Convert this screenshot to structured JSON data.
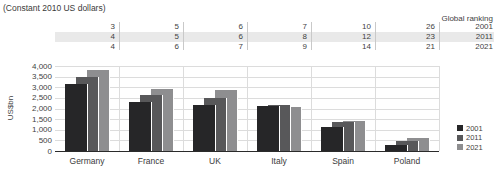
{
  "subtitle": "(Constant 2010 US dollars)",
  "ranking": {
    "header": "Global ranking",
    "rows": [
      {
        "year": "2001",
        "values": [
          "3",
          "5",
          "6",
          "7",
          "10",
          "26"
        ]
      },
      {
        "year": "2011",
        "values": [
          "4",
          "5",
          "6",
          "8",
          "12",
          "23"
        ]
      },
      {
        "year": "2021",
        "values": [
          "4",
          "6",
          "7",
          "9",
          "14",
          "21"
        ]
      }
    ]
  },
  "chart_data": {
    "type": "bar",
    "title": "(Constant 2010 US dollars)",
    "ylabel": "US$bn",
    "ylim": [
      0,
      4000
    ],
    "ytick_step": 500,
    "grid": true,
    "legend_position": "right",
    "categories": [
      "Germany",
      "France",
      "UK",
      "Italy",
      "Spain",
      "Poland"
    ],
    "series": [
      {
        "name": "2001",
        "color": "#262628",
        "values": [
          3150,
          2300,
          2150,
          2100,
          1150,
          300
        ]
      },
      {
        "name": "2011",
        "color": "#58585a",
        "values": [
          3500,
          2650,
          2500,
          2150,
          1370,
          480
        ]
      },
      {
        "name": "2021",
        "color": "#8e8e90",
        "values": [
          3800,
          2900,
          2850,
          2050,
          1400,
          620
        ]
      }
    ],
    "colors": {
      "grid": "#dcdcdc",
      "axis": "#2b2b2b",
      "stripe": "#e9e9e9",
      "separator": "#c9c9c9",
      "text": "#3f3f3f"
    }
  }
}
